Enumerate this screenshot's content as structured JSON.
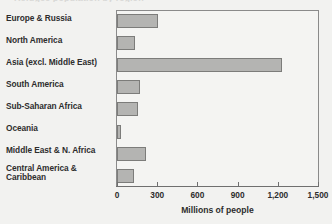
{
  "clipped_header": "Refugee population by region",
  "chart_data": {
    "type": "bar",
    "orientation": "horizontal",
    "title": "",
    "xlabel": "Millions of people",
    "ylabel": "",
    "xlim": [
      0,
      1500
    ],
    "xticks": [
      0,
      300,
      600,
      900,
      1200,
      1500
    ],
    "xtick_labels": [
      "0",
      "300",
      "600",
      "900",
      "1,200",
      "1,500"
    ],
    "grid": false,
    "legend": null,
    "categories": [
      "Europe & Russia",
      "North America",
      "Asia (excl. Middle East)",
      "South America",
      "Sub-Saharan Africa",
      "Oceania",
      "Middle East & N. Africa",
      "Central America & Caribbean"
    ],
    "values": [
      305,
      135,
      1230,
      170,
      155,
      30,
      215,
      125
    ],
    "bar_color": "#b4b4b2",
    "bar_border_color": "#7c7c7a",
    "background_color": "#f2f2f0",
    "axis_color": "#6f6f6f",
    "text_color": "#2d2d2d"
  }
}
